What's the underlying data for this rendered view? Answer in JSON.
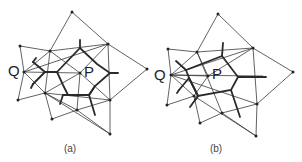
{
  "figure": {
    "panels": [
      {
        "id": "a",
        "caption": "(a)",
        "labels": {
          "q": "Q",
          "p": "P"
        }
      },
      {
        "id": "b",
        "caption": "(b)",
        "labels": {
          "q": "Q",
          "p": "P"
        }
      }
    ]
  },
  "colors": {
    "thin_line": "#3a3a3a",
    "thick_line": "#2a2a2a",
    "background": "#ffffff"
  }
}
